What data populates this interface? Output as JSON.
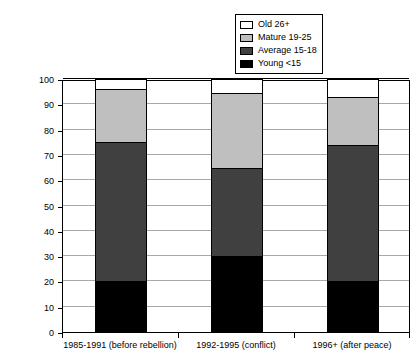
{
  "chart_data": {
    "type": "bar",
    "subtype": "stacked-column",
    "title": "",
    "xlabel": "",
    "ylabel": "Percentage",
    "ylim": [
      0,
      100
    ],
    "yticks": [
      0,
      10,
      20,
      30,
      40,
      50,
      60,
      70,
      80,
      90,
      100
    ],
    "ytick_labels": [
      "0",
      "10",
      "20",
      "30",
      "40",
      "50",
      "60",
      "70",
      "80",
      "90",
      "100"
    ],
    "grid": true,
    "legend_position": "top-right",
    "categories": [
      "1985-1991 (before rebellion)",
      "1992-1995 (conflict)",
      "1996+ (after peace)"
    ],
    "series": [
      {
        "name": "Young <15",
        "color": "#000000",
        "values": [
          20,
          30,
          20
        ]
      },
      {
        "name": "Average 15-18",
        "color": "#404040",
        "values": [
          55,
          35,
          54
        ]
      },
      {
        "name": "Mature 19-25",
        "color": "#bfbfbf",
        "values": [
          21,
          29.5,
          19
        ]
      },
      {
        "name": "Old 26+",
        "color": "#ffffff",
        "values": [
          4,
          5.5,
          7
        ]
      }
    ],
    "stack_tops": [
      96,
      94.5,
      93
    ],
    "legend_order": [
      "Old 26+",
      "Mature 19-25",
      "Average 15-18",
      "Young <15"
    ]
  }
}
